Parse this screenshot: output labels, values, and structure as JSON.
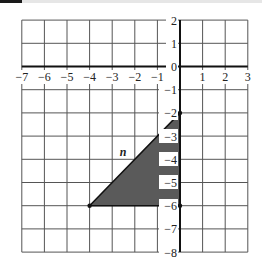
{
  "figure": {
    "type": "coordinate-plane",
    "x_range": [
      -7,
      3
    ],
    "y_range": [
      -8,
      2
    ],
    "x_tick_labels": [
      "-7",
      "-6",
      "-5",
      "-4",
      "-3",
      "-2",
      "-1",
      "1",
      "2",
      "3"
    ],
    "y_tick_labels": [
      "2",
      "1",
      "0",
      "-1",
      "-2",
      "-3",
      "-4",
      "-5",
      "-6",
      "-7",
      "-8"
    ],
    "shape": {
      "type": "triangle",
      "label": "n",
      "vertices": [
        [
          0,
          -2
        ],
        [
          0,
          -6
        ],
        [
          -4,
          -6
        ]
      ],
      "fill_color": "#5a5a5a",
      "stroke_color": "#111111"
    },
    "grid_color": "#444444",
    "axis_color": "#111111"
  },
  "labels": {
    "x": {
      "m7": "−7",
      "m6": "−6",
      "m5": "−5",
      "m4": "−4",
      "m3": "−3",
      "m2": "−2",
      "m1": "−1",
      "p1": "1",
      "p2": "2",
      "p3": "3"
    },
    "y": {
      "p2": "2",
      "p1": "1",
      "z": "0",
      "m1": "−1",
      "m2": "−2",
      "m3": "−3",
      "m4": "−4",
      "m5": "−5",
      "m6": "−6",
      "m7": "−7",
      "m8": "−8"
    },
    "shape": "n"
  }
}
